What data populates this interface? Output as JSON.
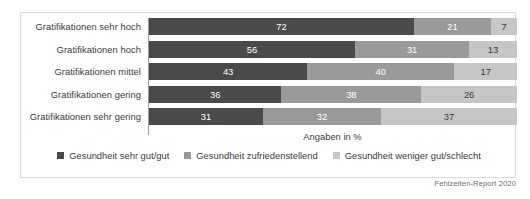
{
  "chart_data": {
    "type": "bar",
    "orientation": "horizontal",
    "stacked": true,
    "normalized_percent": true,
    "title": "",
    "subtitle": "",
    "xlabel": "Angaben in %",
    "ylabel": "",
    "xlim": [
      0,
      100
    ],
    "grid": false,
    "legend_position": "bottom-center",
    "categories": [
      "Gratifikationen sehr hoch",
      "Gratifikationen hoch",
      "Gratifikationen mittel",
      "Gratifikationen gering",
      "Gratifikationen sehr gering"
    ],
    "series": [
      {
        "name": "Gesundheit sehr gut/gut",
        "color": "#4a4a4a",
        "values": [
          72,
          56,
          43,
          36,
          31
        ]
      },
      {
        "name": "Gesundheit zufriedenstellend",
        "color": "#9a9a9a",
        "values": [
          21,
          31,
          40,
          38,
          32
        ]
      },
      {
        "name": "Gesundheit weniger gut/schlecht",
        "color": "#c6c6c6",
        "values": [
          7,
          13,
          17,
          26,
          37
        ]
      }
    ],
    "annotations": {
      "source": "Fehlzeiten-Report 2020"
    }
  },
  "axis": {
    "caption": "Angaben in %"
  },
  "source": {
    "text": "Fehlzeiten-Report 2020"
  },
  "colors": {
    "series_dark": "#4a4a4a",
    "series_mid": "#9a9a9a",
    "series_light": "#c6c6c6",
    "card_border": "#dcdcdc",
    "axis_line": "#9d9d9d",
    "text": "#3a3a3a",
    "background": "#ffffff"
  }
}
